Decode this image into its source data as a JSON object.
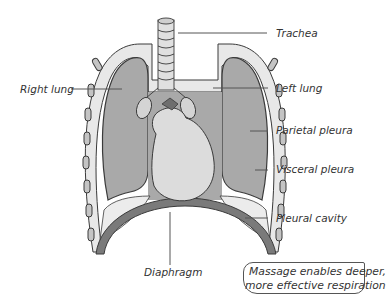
{
  "diagram": {
    "title": "",
    "labels": {
      "trachea": "Trachea",
      "right_lung": "Right lung",
      "left_lung": "Left lung",
      "parietal_pleura": "Parietal pleura",
      "visceral_pleura": "Visceral pleura",
      "pleural_cavity": "Pleural cavity",
      "diaphragm": "Diaphragm"
    },
    "callout": {
      "line1": "Massage enables deeper,",
      "line2": "more effective respiration"
    },
    "colors": {
      "lung_fill": "#a9a9a9",
      "heart_fill": "#dcdcdc",
      "pleura_fill": "#e8e8e8",
      "diaphragm_fill": "#7a7a7a",
      "rib_fill": "#c4c4c4",
      "outline": "#3a3a3a",
      "leader_line": "#555555"
    }
  }
}
